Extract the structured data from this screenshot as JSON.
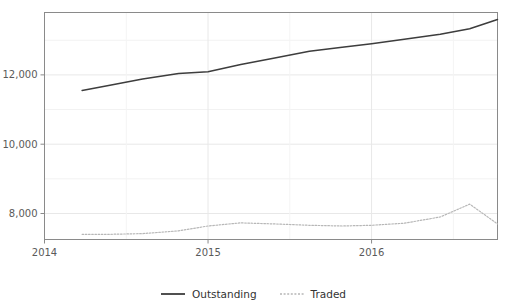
{
  "chart_data": {
    "type": "line",
    "title": "",
    "xlabel": "",
    "ylabel": "",
    "xlim": [
      2014.0,
      2016.77
    ],
    "ylim": [
      7250,
      13800
    ],
    "grid": true,
    "legend_position": "bottom",
    "y_ticks": [
      8000,
      10000,
      12000
    ],
    "y_tick_labels": [
      "8,000",
      "10,000",
      "12,000"
    ],
    "x_ticks": [
      2014,
      2015,
      2016
    ],
    "x_tick_labels": [
      "2014",
      "2015",
      "2016"
    ],
    "series": [
      {
        "name": "Outstanding",
        "style": "solid",
        "color": "#3d3d3d",
        "x": [
          2014.23,
          2014.4,
          2014.6,
          2014.82,
          2015.0,
          2015.2,
          2015.4,
          2015.62,
          2015.82,
          2016.0,
          2016.2,
          2016.42,
          2016.6,
          2016.77
        ],
        "values": [
          11550,
          11700,
          11880,
          12040,
          12090,
          12300,
          12480,
          12680,
          12800,
          12900,
          13030,
          13170,
          13330,
          13600
        ]
      },
      {
        "name": "Traded",
        "style": "dotted",
        "color": "#b7b7b7",
        "x": [
          2014.23,
          2014.4,
          2014.6,
          2014.82,
          2015.0,
          2015.2,
          2015.4,
          2015.62,
          2015.82,
          2016.0,
          2016.2,
          2016.42,
          2016.6,
          2016.77
        ],
        "values": [
          7400,
          7400,
          7420,
          7500,
          7640,
          7730,
          7700,
          7660,
          7640,
          7660,
          7720,
          7900,
          8270,
          7700
        ]
      }
    ]
  },
  "legend": {
    "items": [
      {
        "label": "Outstanding",
        "style": "solid",
        "color": "#3d3d3d"
      },
      {
        "label": "Traded",
        "style": "dotted",
        "color": "#b7b7b7"
      }
    ]
  },
  "axes": {
    "frame_color": "#8a8a8a",
    "grid_color": "#e8e8e8",
    "tick_color": "#8a8a8a"
  }
}
